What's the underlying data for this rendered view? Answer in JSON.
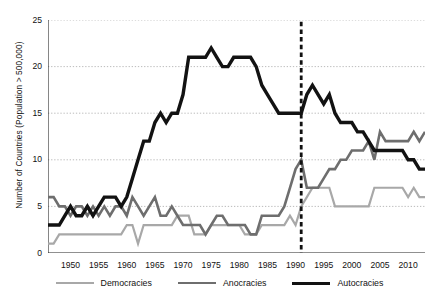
{
  "chart_data": {
    "type": "line",
    "title": "",
    "xlabel": "",
    "ylabel": "Number of Countries (Population > 500,000)",
    "xlim": [
      1946,
      2013
    ],
    "ylim": [
      0,
      25
    ],
    "yticks": [
      0,
      5,
      10,
      15,
      20,
      25
    ],
    "xticks": [
      1950,
      1955,
      1960,
      1965,
      1970,
      1975,
      1980,
      1985,
      1990,
      1995,
      2000,
      2005,
      2010
    ],
    "xtick_labels": [
      "1950",
      "1955",
      "1960",
      "1965",
      "1970",
      "1975",
      "1980",
      "1985",
      "1990",
      "1995",
      "2000",
      "2005",
      "2010"
    ],
    "ytick_labels": [
      "0",
      "5",
      "10",
      "15",
      "20",
      "25"
    ],
    "grid": "horizontal-dotted",
    "minor_xticks_interval": 1,
    "legend_position": "bottom",
    "annotations": [
      {
        "type": "vline",
        "x": 1991,
        "style": "dashed",
        "color": "#111111",
        "label": ""
      }
    ],
    "x": [
      1946,
      1947,
      1948,
      1949,
      1950,
      1951,
      1952,
      1953,
      1954,
      1955,
      1956,
      1957,
      1958,
      1959,
      1960,
      1961,
      1962,
      1963,
      1964,
      1965,
      1966,
      1967,
      1968,
      1969,
      1970,
      1971,
      1972,
      1973,
      1974,
      1975,
      1976,
      1977,
      1978,
      1979,
      1980,
      1981,
      1982,
      1983,
      1984,
      1985,
      1986,
      1987,
      1988,
      1989,
      1990,
      1991,
      1992,
      1993,
      1994,
      1995,
      1996,
      1997,
      1998,
      1999,
      2000,
      2001,
      2002,
      2003,
      2004,
      2005,
      2006,
      2007,
      2008,
      2009,
      2010,
      2011,
      2012,
      2013
    ],
    "series": [
      {
        "name": "Democracies",
        "color": "#a8a8a8",
        "values": [
          1,
          1,
          2,
          2,
          2,
          2,
          2,
          2,
          2,
          2,
          2,
          2,
          2,
          2,
          3,
          3,
          1,
          3,
          3,
          3,
          3,
          3,
          3,
          4,
          4,
          4,
          2,
          2,
          2,
          3,
          3,
          3,
          3,
          3,
          3,
          2,
          2,
          2,
          3,
          3,
          3,
          3,
          3,
          4,
          3,
          5,
          6,
          7,
          7,
          7,
          7,
          5,
          5,
          5,
          5,
          5,
          5,
          5,
          7,
          7,
          7,
          7,
          7,
          7,
          6,
          7,
          6,
          6
        ]
      },
      {
        "name": "Anocracies",
        "color": "#6e6e6e",
        "values": [
          6,
          6,
          5,
          5,
          4,
          5,
          5,
          4,
          5,
          4,
          5,
          4,
          5,
          5,
          4,
          6,
          5,
          4,
          5,
          6,
          4,
          4,
          5,
          4,
          3,
          3,
          3,
          3,
          2,
          3,
          4,
          4,
          3,
          3,
          3,
          3,
          2,
          2,
          4,
          4,
          4,
          4,
          5,
          7,
          9,
          10,
          7,
          7,
          7,
          8,
          9,
          9,
          10,
          10,
          11,
          11,
          11,
          12,
          10,
          13,
          12,
          12,
          12,
          12,
          12,
          13,
          12,
          13
        ]
      },
      {
        "name": "Autocracies",
        "color": "#121212",
        "values": [
          3,
          3,
          3,
          4,
          5,
          4,
          4,
          5,
          4,
          5,
          6,
          6,
          6,
          5,
          6,
          8,
          10,
          12,
          12,
          14,
          15,
          14,
          15,
          15,
          17,
          21,
          21,
          21,
          21,
          22,
          21,
          20,
          20,
          21,
          21,
          21,
          21,
          20,
          18,
          17,
          16,
          15,
          15,
          15,
          15,
          15,
          17,
          18,
          17,
          16,
          17,
          15,
          14,
          14,
          14,
          13,
          13,
          12,
          11,
          11,
          11,
          11,
          11,
          11,
          10,
          10,
          9,
          9
        ]
      }
    ]
  },
  "legend": {
    "items": [
      {
        "label": "Democracies",
        "color": "#a8a8a8",
        "width": 2.2
      },
      {
        "label": "Anocracies",
        "color": "#6e6e6e",
        "width": 2.6
      },
      {
        "label": "Autocracies",
        "color": "#121212",
        "width": 3.4
      }
    ]
  }
}
